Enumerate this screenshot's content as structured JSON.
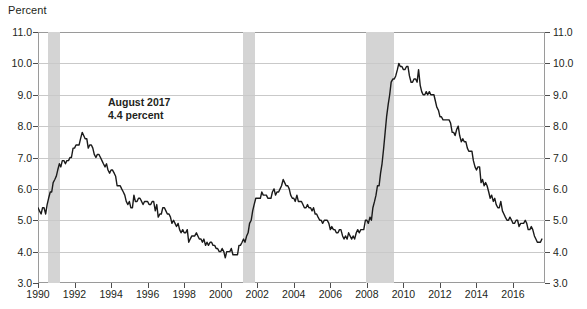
{
  "axis_title": "Percent",
  "annotation": "August 2017\n4.4 percent",
  "annotation_lines": [
    "August 2017",
    "4.4 percent"
  ],
  "chart_data": {
    "type": "line",
    "title": "",
    "subtitle": "",
    "xlabel": "",
    "ylabel": "Percent",
    "ylim": [
      3.0,
      11.0
    ],
    "xlim": [
      1990.0,
      2017.75
    ],
    "grid": true,
    "legend": "none",
    "y_ticks": [
      "3.0",
      "4.0",
      "5.0",
      "6.0",
      "7.0",
      "8.0",
      "9.0",
      "10.0",
      "11.0"
    ],
    "y_tick_values": [
      3.0,
      4.0,
      5.0,
      6.0,
      7.0,
      8.0,
      9.0,
      10.0,
      11.0
    ],
    "y_axis_right_ticks": [
      "3.0",
      "4.0",
      "5.0",
      "6.0",
      "7.0",
      "8.0",
      "9.0",
      "10.0",
      "11.0"
    ],
    "x_ticks": [
      "1990",
      "1992",
      "1994",
      "1996",
      "1998",
      "2000",
      "2002",
      "2004",
      "2006",
      "2008",
      "2010",
      "2012",
      "2014",
      "2016"
    ],
    "x_tick_values": [
      1990,
      1992,
      1994,
      1996,
      1998,
      2000,
      2002,
      2004,
      2006,
      2008,
      2010,
      2012,
      2014,
      2016
    ],
    "annotations": [
      {
        "text": "August 2017 / 4.4 percent",
        "x": 1994.6,
        "y": 8.3
      }
    ],
    "shaded_bands": [
      {
        "label": "recession-1990-1991",
        "x0": 1990.54,
        "x1": 1991.21,
        "color": "#d4d4d4"
      },
      {
        "label": "recession-2001",
        "x0": 2001.21,
        "x1": 2001.88,
        "color": "#d4d4d4"
      },
      {
        "label": "recession-2007-2009",
        "x0": 2007.96,
        "x1": 2009.46,
        "color": "#d4d4d4"
      }
    ],
    "series": [
      {
        "name": "Unemployment rate",
        "color": "#1a1a1a",
        "x": [
          1990.0,
          1990.08,
          1990.17,
          1990.25,
          1990.33,
          1990.42,
          1990.5,
          1990.58,
          1990.67,
          1990.75,
          1990.83,
          1990.92,
          1991.0,
          1991.08,
          1991.17,
          1991.25,
          1991.33,
          1991.42,
          1991.5,
          1991.58,
          1991.67,
          1991.75,
          1991.83,
          1991.92,
          1992.0,
          1992.08,
          1992.17,
          1992.25,
          1992.33,
          1992.42,
          1992.5,
          1992.58,
          1992.67,
          1992.75,
          1992.83,
          1992.92,
          1993.0,
          1993.08,
          1993.17,
          1993.25,
          1993.33,
          1993.42,
          1993.5,
          1993.58,
          1993.67,
          1993.75,
          1993.83,
          1993.92,
          1994.0,
          1994.08,
          1994.17,
          1994.25,
          1994.33,
          1994.42,
          1994.5,
          1994.58,
          1994.67,
          1994.75,
          1994.83,
          1994.92,
          1995.0,
          1995.08,
          1995.17,
          1995.25,
          1995.33,
          1995.42,
          1995.5,
          1995.58,
          1995.67,
          1995.75,
          1995.83,
          1995.92,
          1996.0,
          1996.08,
          1996.17,
          1996.25,
          1996.33,
          1996.42,
          1996.5,
          1996.58,
          1996.67,
          1996.75,
          1996.83,
          1996.92,
          1997.0,
          1997.08,
          1997.17,
          1997.25,
          1997.33,
          1997.42,
          1997.5,
          1997.58,
          1997.67,
          1997.75,
          1997.83,
          1997.92,
          1998.0,
          1998.08,
          1998.17,
          1998.25,
          1998.33,
          1998.42,
          1998.5,
          1998.58,
          1998.67,
          1998.75,
          1998.83,
          1998.92,
          1999.0,
          1999.08,
          1999.17,
          1999.25,
          1999.33,
          1999.42,
          1999.5,
          1999.58,
          1999.67,
          1999.75,
          1999.83,
          1999.92,
          2000.0,
          2000.08,
          2000.17,
          2000.25,
          2000.33,
          2000.42,
          2000.5,
          2000.58,
          2000.67,
          2000.75,
          2000.83,
          2000.92,
          2001.0,
          2001.08,
          2001.17,
          2001.25,
          2001.33,
          2001.42,
          2001.5,
          2001.58,
          2001.67,
          2001.75,
          2001.83,
          2001.92,
          2002.0,
          2002.08,
          2002.17,
          2002.25,
          2002.33,
          2002.42,
          2002.5,
          2002.58,
          2002.67,
          2002.75,
          2002.83,
          2002.92,
          2003.0,
          2003.08,
          2003.17,
          2003.25,
          2003.33,
          2003.42,
          2003.5,
          2003.58,
          2003.67,
          2003.75,
          2003.83,
          2003.92,
          2004.0,
          2004.08,
          2004.17,
          2004.25,
          2004.33,
          2004.42,
          2004.5,
          2004.58,
          2004.67,
          2004.75,
          2004.83,
          2004.92,
          2005.0,
          2005.08,
          2005.17,
          2005.25,
          2005.33,
          2005.42,
          2005.5,
          2005.58,
          2005.67,
          2005.75,
          2005.83,
          2005.92,
          2006.0,
          2006.08,
          2006.17,
          2006.25,
          2006.33,
          2006.42,
          2006.5,
          2006.58,
          2006.67,
          2006.75,
          2006.83,
          2006.92,
          2007.0,
          2007.08,
          2007.17,
          2007.25,
          2007.33,
          2007.42,
          2007.5,
          2007.58,
          2007.67,
          2007.75,
          2007.83,
          2007.92,
          2008.0,
          2008.08,
          2008.17,
          2008.25,
          2008.33,
          2008.42,
          2008.5,
          2008.58,
          2008.67,
          2008.75,
          2008.83,
          2008.92,
          2009.0,
          2009.08,
          2009.17,
          2009.25,
          2009.33,
          2009.42,
          2009.5,
          2009.58,
          2009.67,
          2009.75,
          2009.83,
          2009.92,
          2010.0,
          2010.08,
          2010.17,
          2010.25,
          2010.33,
          2010.42,
          2010.5,
          2010.58,
          2010.67,
          2010.75,
          2010.83,
          2010.92,
          2011.0,
          2011.08,
          2011.17,
          2011.25,
          2011.33,
          2011.42,
          2011.5,
          2011.58,
          2011.67,
          2011.75,
          2011.83,
          2011.92,
          2012.0,
          2012.08,
          2012.17,
          2012.25,
          2012.33,
          2012.42,
          2012.5,
          2012.58,
          2012.67,
          2012.75,
          2012.83,
          2012.92,
          2013.0,
          2013.08,
          2013.17,
          2013.25,
          2013.33,
          2013.42,
          2013.5,
          2013.58,
          2013.67,
          2013.75,
          2013.83,
          2013.92,
          2014.0,
          2014.08,
          2014.17,
          2014.25,
          2014.33,
          2014.42,
          2014.5,
          2014.58,
          2014.67,
          2014.75,
          2014.83,
          2014.92,
          2015.0,
          2015.08,
          2015.17,
          2015.25,
          2015.33,
          2015.42,
          2015.5,
          2015.58,
          2015.67,
          2015.75,
          2015.83,
          2015.92,
          2016.0,
          2016.08,
          2016.17,
          2016.25,
          2016.33,
          2016.42,
          2016.5,
          2016.58,
          2016.67,
          2016.75,
          2016.83,
          2016.92,
          2017.0,
          2017.08,
          2017.17,
          2017.25,
          2017.33,
          2017.42,
          2017.5,
          2017.58
        ],
        "values": [
          5.4,
          5.3,
          5.2,
          5.4,
          5.4,
          5.2,
          5.5,
          5.7,
          5.9,
          5.9,
          6.2,
          6.3,
          6.4,
          6.6,
          6.8,
          6.7,
          6.9,
          6.9,
          6.8,
          6.9,
          6.9,
          7.0,
          7.0,
          7.3,
          7.3,
          7.4,
          7.4,
          7.4,
          7.6,
          7.8,
          7.7,
          7.6,
          7.6,
          7.3,
          7.4,
          7.4,
          7.3,
          7.1,
          7.0,
          7.1,
          7.1,
          7.0,
          6.9,
          6.8,
          6.7,
          6.8,
          6.6,
          6.5,
          6.6,
          6.6,
          6.5,
          6.4,
          6.1,
          6.1,
          6.1,
          6.0,
          5.9,
          5.8,
          5.6,
          5.5,
          5.6,
          5.4,
          5.4,
          5.8,
          5.6,
          5.6,
          5.7,
          5.7,
          5.6,
          5.5,
          5.6,
          5.6,
          5.6,
          5.5,
          5.5,
          5.6,
          5.6,
          5.3,
          5.5,
          5.1,
          5.2,
          5.2,
          5.4,
          5.4,
          5.3,
          5.2,
          5.2,
          5.1,
          4.9,
          5.0,
          4.9,
          4.8,
          4.9,
          4.7,
          4.6,
          4.7,
          4.6,
          4.6,
          4.7,
          4.3,
          4.4,
          4.5,
          4.5,
          4.5,
          4.6,
          4.5,
          4.4,
          4.4,
          4.3,
          4.4,
          4.2,
          4.3,
          4.2,
          4.3,
          4.3,
          4.2,
          4.2,
          4.1,
          4.1,
          4.0,
          4.0,
          4.1,
          4.0,
          3.8,
          4.0,
          4.0,
          4.0,
          4.1,
          3.9,
          3.9,
          3.9,
          3.9,
          4.2,
          4.2,
          4.3,
          4.4,
          4.3,
          4.5,
          4.6,
          4.9,
          5.0,
          5.3,
          5.5,
          5.7,
          5.7,
          5.7,
          5.7,
          5.9,
          5.8,
          5.8,
          5.8,
          5.7,
          5.7,
          5.7,
          5.9,
          6.0,
          5.8,
          5.9,
          5.9,
          6.0,
          6.1,
          6.3,
          6.2,
          6.1,
          6.1,
          6.0,
          5.8,
          5.7,
          5.7,
          5.6,
          5.8,
          5.6,
          5.6,
          5.6,
          5.5,
          5.4,
          5.4,
          5.5,
          5.4,
          5.4,
          5.3,
          5.4,
          5.2,
          5.2,
          5.1,
          5.0,
          5.0,
          4.9,
          5.0,
          5.0,
          5.0,
          4.9,
          4.7,
          4.8,
          4.7,
          4.7,
          4.6,
          4.6,
          4.7,
          4.7,
          4.5,
          4.4,
          4.5,
          4.4,
          4.6,
          4.5,
          4.4,
          4.5,
          4.4,
          4.6,
          4.7,
          4.6,
          4.7,
          4.7,
          4.7,
          5.0,
          5.0,
          4.9,
          5.1,
          5.0,
          5.4,
          5.6,
          5.8,
          6.1,
          6.1,
          6.5,
          6.8,
          7.3,
          7.8,
          8.3,
          8.7,
          9.0,
          9.4,
          9.5,
          9.5,
          9.6,
          9.8,
          10.0,
          9.9,
          9.9,
          9.8,
          9.8,
          9.9,
          9.9,
          9.6,
          9.4,
          9.4,
          9.5,
          9.5,
          9.4,
          9.8,
          9.3,
          9.1,
          9.0,
          9.0,
          9.1,
          9.0,
          9.1,
          9.0,
          9.0,
          9.0,
          8.8,
          8.6,
          8.5,
          8.3,
          8.3,
          8.2,
          8.2,
          8.2,
          8.2,
          8.2,
          8.1,
          7.8,
          7.8,
          7.7,
          7.9,
          8.0,
          7.7,
          7.5,
          7.6,
          7.5,
          7.5,
          7.3,
          7.2,
          7.2,
          7.2,
          6.9,
          6.7,
          6.6,
          6.7,
          6.7,
          6.2,
          6.3,
          6.1,
          6.2,
          6.1,
          5.9,
          5.7,
          5.8,
          5.6,
          5.7,
          5.5,
          5.4,
          5.4,
          5.6,
          5.3,
          5.2,
          5.1,
          5.0,
          5.0,
          5.1,
          5.0,
          4.9,
          4.9,
          5.0,
          5.0,
          4.8,
          4.9,
          4.9,
          4.9,
          5.0,
          4.9,
          4.7,
          4.7,
          4.8,
          4.7,
          4.5,
          4.4,
          4.3,
          4.3,
          4.3,
          4.4
        ]
      }
    ]
  },
  "colors": {
    "line": "#1a1a1a",
    "recession_band": "#d4d4d4",
    "gridline": "#c9c9c9",
    "frame": "#9a9a9a",
    "text": "#231f20",
    "background": "#ffffff"
  }
}
